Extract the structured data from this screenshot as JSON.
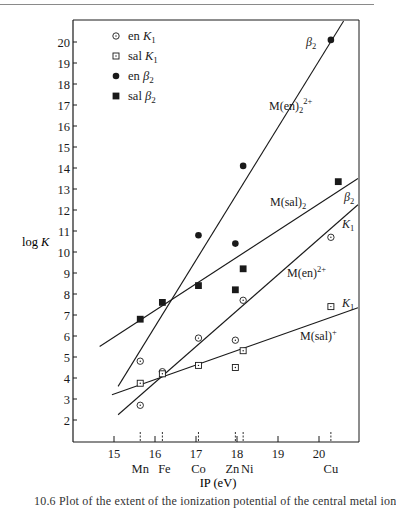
{
  "chart_data": {
    "type": "scatter",
    "title": "",
    "xlabel": "IP (eV)",
    "ylabel": "log K",
    "xlim": [
      14.6,
      21.0
    ],
    "ylim": [
      1.0,
      21.0
    ],
    "x_ticks": [
      15,
      16,
      17,
      18,
      19,
      20
    ],
    "y_ticks": [
      2,
      3,
      4,
      5,
      6,
      7,
      8,
      9,
      10,
      11,
      12,
      13,
      14,
      15,
      16,
      17,
      18,
      19,
      20
    ],
    "grid": false,
    "legend_position": "upper-left",
    "metals": [
      {
        "symbol": "Mn",
        "ip": 15.64
      },
      {
        "symbol": "Fe",
        "ip": 16.18
      },
      {
        "symbol": "Co",
        "ip": 17.06
      },
      {
        "symbol": "Zn",
        "ip": 17.96
      },
      {
        "symbol": "Ni",
        "ip": 18.15
      },
      {
        "symbol": "Cu",
        "ip": 20.29
      }
    ],
    "series": [
      {
        "name": "en K1",
        "marker": "open-circle",
        "points": [
          {
            "metal": "Mn",
            "x": 15.64,
            "y": 2.7
          },
          {
            "metal": "Mn",
            "x": 15.64,
            "y": 4.8
          },
          {
            "metal": "Fe",
            "x": 16.18,
            "y": 4.3
          },
          {
            "metal": "Co",
            "x": 17.06,
            "y": 5.9
          },
          {
            "metal": "Zn",
            "x": 17.96,
            "y": 5.8
          },
          {
            "metal": "Ni",
            "x": 18.15,
            "y": 7.7
          },
          {
            "metal": "Cu",
            "x": 20.29,
            "y": 10.7
          }
        ]
      },
      {
        "name": "sal K1",
        "marker": "open-square",
        "points": [
          {
            "metal": "Mn",
            "x": 15.64,
            "y": 3.75
          },
          {
            "metal": "Fe",
            "x": 16.18,
            "y": 4.2
          },
          {
            "metal": "Co",
            "x": 17.06,
            "y": 4.6
          },
          {
            "metal": "Zn",
            "x": 17.96,
            "y": 4.5
          },
          {
            "metal": "Ni",
            "x": 18.15,
            "y": 5.3
          },
          {
            "metal": "Cu",
            "x": 20.29,
            "y": 7.4
          }
        ]
      },
      {
        "name": "en β2",
        "marker": "filled-circle",
        "points": [
          {
            "metal": "Co",
            "x": 17.06,
            "y": 10.8
          },
          {
            "metal": "Zn",
            "x": 17.96,
            "y": 10.4
          },
          {
            "metal": "Ni",
            "x": 18.15,
            "y": 14.1
          },
          {
            "metal": "Cu",
            "x": 20.29,
            "y": 20.1
          }
        ]
      },
      {
        "name": "sal β2",
        "marker": "filled-square",
        "points": [
          {
            "metal": "Mn",
            "x": 15.64,
            "y": 6.8
          },
          {
            "metal": "Fe",
            "x": 16.18,
            "y": 7.6
          },
          {
            "metal": "Co",
            "x": 17.06,
            "y": 8.4
          },
          {
            "metal": "Zn",
            "x": 17.96,
            "y": 8.2
          },
          {
            "metal": "Ni",
            "x": 18.15,
            "y": 9.2
          },
          {
            "metal": "Cu",
            "x": 20.47,
            "y": 13.35
          }
        ]
      }
    ],
    "fit_lines": [
      {
        "name": "M(en)2 2+",
        "label_main": "M(en)",
        "label_sub": "2",
        "label_sup": "2+",
        "x1": 15.1,
        "y1": 3.6,
        "x2": 20.6,
        "y2": 21.0
      },
      {
        "name": "M(sal)2",
        "label_main": "M(sal)",
        "label_sub": "2",
        "label_sup": "",
        "x1": 14.65,
        "y1": 5.5,
        "x2": 20.95,
        "y2": 13.5
      },
      {
        "name": "M(en)2+",
        "label_main": "M(en)",
        "label_sub": "",
        "label_sup": "2+",
        "x1": 15.1,
        "y1": 2.25,
        "x2": 20.95,
        "y2": 12.25
      },
      {
        "name": "M(sal)+",
        "label_main": "M(sal)",
        "label_sub": "",
        "label_sup": "+",
        "x1": 14.95,
        "y1": 3.2,
        "x2": 20.95,
        "y2": 7.35
      }
    ],
    "annotations": [
      {
        "text": "β2",
        "near": "en β2 Cu"
      },
      {
        "text": "M(en)2 2+",
        "near": "upper line"
      },
      {
        "text": "M(sal)2",
        "near": "sal β2 line"
      },
      {
        "text": "β2",
        "near": "sal β2 line end"
      },
      {
        "text": "K1",
        "near": "en K1 line end"
      },
      {
        "text": "M(en)2+",
        "near": "en K1 line"
      },
      {
        "text": "K1",
        "near": "sal K1 line end"
      },
      {
        "text": "M(sal)+",
        "near": "sal K1 line"
      }
    ]
  },
  "legend": [
    {
      "marker": "open-circle",
      "label": "en",
      "sym": "K",
      "sub": "1"
    },
    {
      "marker": "open-square",
      "label": "sal",
      "sym": "K",
      "sub": "1"
    },
    {
      "marker": "filled-circle",
      "label": "en",
      "sym": "β",
      "sub": "2"
    },
    {
      "marker": "filled-square",
      "label": "sal",
      "sym": "β",
      "sub": "2"
    }
  ],
  "axes": {
    "ylabel": "log K",
    "xlabel": "IP (eV)"
  },
  "caption": "10.6  Plot of the extent of the ionization potential of the central metal ion"
}
